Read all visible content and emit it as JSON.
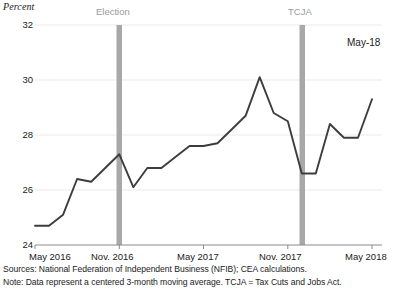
{
  "chart_data": {
    "type": "line",
    "title": "",
    "ylabel": "Percent",
    "xlabel": "",
    "ylim": [
      24,
      32
    ],
    "xlim": [
      "May 2016",
      "May 2018"
    ],
    "grid": true,
    "legend_position": "none",
    "y_ticks": [
      "32",
      "30",
      "28",
      "26",
      "24"
    ],
    "x_ticks": [
      "May 2016",
      "Nov. 2016",
      "May 2017",
      "Nov. 2017",
      "May 2018"
    ],
    "series": [
      {
        "name": "NFIB expected better business conditions (3-month centered moving average)",
        "color": "#3d3d3d",
        "x": [
          "May 2016",
          "Jun 2016",
          "Jul 2016",
          "Aug 2016",
          "Sep 2016",
          "Oct 2016",
          "Nov 2016",
          "Dec 2016",
          "Jan 2017",
          "Feb 2017",
          "Mar 2017",
          "Apr 2017",
          "May 2017",
          "Jun 2017",
          "Jul 2017",
          "Aug 2017",
          "Sep 2017",
          "Oct 2017",
          "Nov 2017",
          "Dec 2017",
          "Jan 2018",
          "Feb 2018",
          "Mar 2018",
          "Apr 2018",
          "May 2018"
        ],
        "values": [
          24.7,
          24.7,
          25.1,
          26.4,
          26.3,
          26.8,
          27.3,
          26.1,
          26.8,
          26.8,
          27.2,
          27.6,
          27.6,
          27.7,
          28.2,
          28.7,
          30.1,
          28.8,
          28.5,
          26.6,
          26.6,
          28.4,
          27.9,
          27.9,
          29.3
        ]
      }
    ],
    "annotations": [
      {
        "name": "election-band",
        "label": "Election",
        "x": "Nov 2016",
        "color": "#a8a8a8"
      },
      {
        "name": "tcja-band",
        "label": "TCJA",
        "x": "Dec 2017",
        "color": "#a8a8a8"
      },
      {
        "name": "endpoint-label",
        "label": "May-18"
      }
    ]
  },
  "axis": {
    "y_title": "Percent",
    "y_ticks": [
      "32",
      "30",
      "28",
      "26",
      "24"
    ],
    "x_ticks": [
      "May 2016",
      "Nov. 2016",
      "May 2017",
      "Nov. 2017",
      "May 2018"
    ]
  },
  "annotations": {
    "election": "Election",
    "tcja": "TCJA",
    "endpoint": "May-18"
  },
  "footnotes": {
    "sources": "Sources: National Federation of Independent Business (NFIB); CEA calculations.",
    "note": "Note: Data represent a centered 3-month moving average. TCJA = Tax Cuts and Jobs Act."
  },
  "colors": {
    "line": "#3d3d3d",
    "band": "#a8a8a8",
    "grid": "#e9e9e9",
    "axis": "#8a8a8a",
    "text": "#1a1a1a",
    "band_label": "#9a9a9a"
  }
}
